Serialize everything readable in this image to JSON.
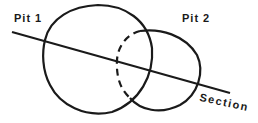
{
  "diagram": {
    "labels": {
      "pit1": "Pit 1",
      "pit2": "Pit 2",
      "section": "Section"
    },
    "colors": {
      "stroke": "#1a1a1a",
      "background": "#ffffff"
    }
  }
}
